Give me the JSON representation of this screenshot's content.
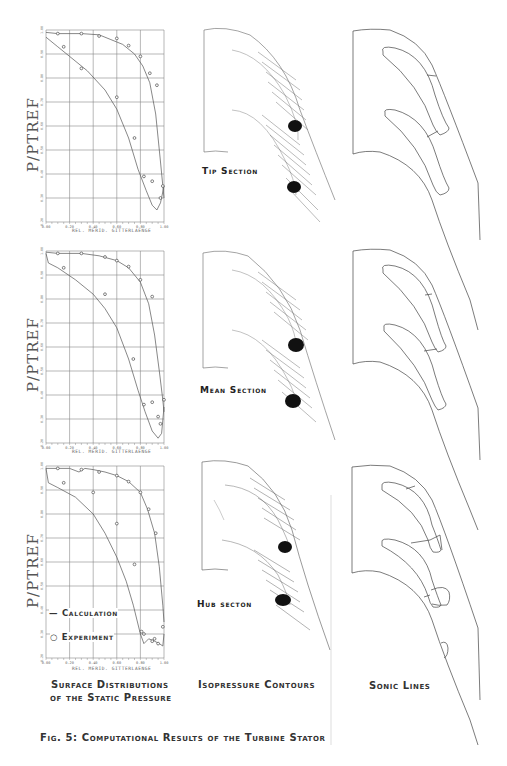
{
  "figure": {
    "caption": "Fig. 5: Computational Results of the Turbine Stator",
    "column_captions": {
      "surface_line1": "Surface Distributions",
      "surface_line2": "of the Static Pressure",
      "isopressure": "Isopressure Contours",
      "sonic": "Sonic Lines"
    },
    "section_labels": {
      "tip": "Tip Section",
      "mean": "Mean Section",
      "hub": "Hub secton"
    },
    "legend": {
      "calculation": "Calculation",
      "experiment": "Experiment"
    }
  },
  "chart_data": [
    {
      "type": "line",
      "title": "Tip Section",
      "xlabel": "REL. MERID. GITTERLAENGE",
      "ylabel": "P/PTREF",
      "xlim": [
        0.0,
        1.0
      ],
      "ylim": [
        0.2,
        1.0
      ],
      "xticks": [
        "0.00",
        "0.20",
        "0.40",
        "0.60",
        "0.80",
        "1.00"
      ],
      "grid": true,
      "series": [
        {
          "name": "Calculation (pressure side)",
          "x": [
            0.0,
            0.1,
            0.3,
            0.45,
            0.55,
            0.65,
            0.75,
            0.82,
            0.88,
            0.93,
            0.97,
            1.0
          ],
          "y": [
            0.99,
            0.985,
            0.985,
            0.98,
            0.96,
            0.94,
            0.9,
            0.85,
            0.78,
            0.65,
            0.45,
            0.3
          ]
        },
        {
          "name": "Calculation (suction side)",
          "x": [
            0.0,
            0.1,
            0.2,
            0.35,
            0.5,
            0.6,
            0.7,
            0.78,
            0.85,
            0.9,
            0.94,
            0.97,
            1.0
          ],
          "y": [
            0.97,
            0.93,
            0.89,
            0.83,
            0.75,
            0.67,
            0.55,
            0.42,
            0.33,
            0.27,
            0.25,
            0.28,
            0.35
          ]
        },
        {
          "name": "Experiment (pressure side)",
          "x": [
            0.1,
            0.3,
            0.45,
            0.6,
            0.7,
            0.8,
            0.88,
            0.94
          ],
          "y": [
            0.985,
            0.985,
            0.975,
            0.965,
            0.935,
            0.89,
            0.82,
            0.77
          ]
        },
        {
          "name": "Experiment (suction side)",
          "x": [
            0.15,
            0.3,
            0.6,
            0.75,
            0.83,
            0.9,
            0.97,
            0.99
          ],
          "y": [
            0.93,
            0.84,
            0.72,
            0.55,
            0.39,
            0.37,
            0.3,
            0.35
          ]
        }
      ]
    },
    {
      "type": "line",
      "title": "Mean Section",
      "xlabel": "REL. MERID. GITTERLAENGE",
      "ylabel": "P/PTREF",
      "xlim": [
        0.0,
        1.0
      ],
      "ylim": [
        0.2,
        1.0
      ],
      "xticks": [
        "0.00",
        "0.20",
        "0.40",
        "0.60",
        "0.80",
        "1.00"
      ],
      "grid": true,
      "series": [
        {
          "name": "Calculation (pressure side)",
          "x": [
            0.0,
            0.1,
            0.3,
            0.45,
            0.6,
            0.7,
            0.8,
            0.87,
            0.92,
            0.96,
            0.99,
            1.0
          ],
          "y": [
            0.995,
            0.99,
            0.99,
            0.98,
            0.96,
            0.93,
            0.87,
            0.78,
            0.65,
            0.5,
            0.38,
            0.33
          ]
        },
        {
          "name": "Calculation (suction side)",
          "x": [
            0.0,
            0.02,
            0.1,
            0.25,
            0.4,
            0.5,
            0.6,
            0.7,
            0.78,
            0.84,
            0.9,
            0.95,
            0.98,
            1.0
          ],
          "y": [
            0.99,
            0.95,
            0.93,
            0.88,
            0.82,
            0.76,
            0.68,
            0.55,
            0.42,
            0.33,
            0.25,
            0.22,
            0.24,
            0.35
          ]
        },
        {
          "name": "Experiment (pressure side)",
          "x": [
            0.1,
            0.3,
            0.5,
            0.6,
            0.7,
            0.8,
            0.9
          ],
          "y": [
            0.99,
            0.99,
            0.975,
            0.96,
            0.935,
            0.88,
            0.81
          ]
        },
        {
          "name": "Experiment (suction side)",
          "x": [
            0.15,
            0.5,
            0.74,
            0.83,
            0.9,
            0.95,
            0.97,
            1.0
          ],
          "y": [
            0.93,
            0.82,
            0.55,
            0.36,
            0.37,
            0.31,
            0.28,
            0.38
          ]
        }
      ]
    },
    {
      "type": "line",
      "title": "Hub Section",
      "xlabel": "REL. MERID. GITTERLAENGE",
      "ylabel": "P/PTREF",
      "xlim": [
        0.0,
        1.0
      ],
      "ylim": [
        0.2,
        1.0
      ],
      "xticks": [
        "0.00",
        "0.20",
        "0.40",
        "0.60",
        "0.80",
        "1.00"
      ],
      "grid": true,
      "series": [
        {
          "name": "Calculation (pressure side)",
          "x": [
            0.0,
            0.1,
            0.2,
            0.28,
            0.33,
            0.4,
            0.5,
            0.6,
            0.7,
            0.8,
            0.86,
            0.92,
            0.96,
            0.99,
            1.0
          ],
          "y": [
            0.99,
            0.99,
            0.99,
            0.975,
            0.99,
            0.985,
            0.975,
            0.96,
            0.935,
            0.89,
            0.82,
            0.72,
            0.58,
            0.42,
            0.35
          ]
        },
        {
          "name": "Calculation (suction side)",
          "x": [
            0.0,
            0.02,
            0.1,
            0.25,
            0.4,
            0.5,
            0.6,
            0.68,
            0.74,
            0.8,
            0.83,
            0.87,
            0.92,
            0.96,
            0.99,
            1.0
          ],
          "y": [
            0.99,
            0.93,
            0.91,
            0.87,
            0.8,
            0.72,
            0.62,
            0.52,
            0.42,
            0.3,
            0.26,
            0.28,
            0.27,
            0.26,
            0.25,
            0.3
          ]
        },
        {
          "name": "Experiment (pressure side)",
          "x": [
            0.1,
            0.3,
            0.45,
            0.6,
            0.7,
            0.8,
            0.87,
            0.93
          ],
          "y": [
            0.99,
            0.985,
            0.975,
            0.96,
            0.935,
            0.89,
            0.82,
            0.72
          ]
        },
        {
          "name": "Experiment (suction side)",
          "x": [
            0.15,
            0.4,
            0.6,
            0.75,
            0.81,
            0.83,
            0.9,
            0.92,
            0.95,
            0.99
          ],
          "y": [
            0.93,
            0.89,
            0.76,
            0.59,
            0.31,
            0.3,
            0.27,
            0.28,
            0.26,
            0.33
          ]
        }
      ]
    }
  ]
}
